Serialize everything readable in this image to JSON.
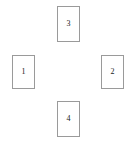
{
  "diagram": {
    "type": "node-layout",
    "background_color": "#ffffff",
    "border_color": "#9a9a9a",
    "text_color": "#1a1a1a",
    "nodes": [
      {
        "id": "node-1",
        "label": "1",
        "position": "left"
      },
      {
        "id": "node-2",
        "label": "2",
        "position": "right"
      },
      {
        "id": "node-3",
        "label": "3",
        "position": "top"
      },
      {
        "id": "node-4",
        "label": "4",
        "position": "bottom"
      }
    ]
  }
}
